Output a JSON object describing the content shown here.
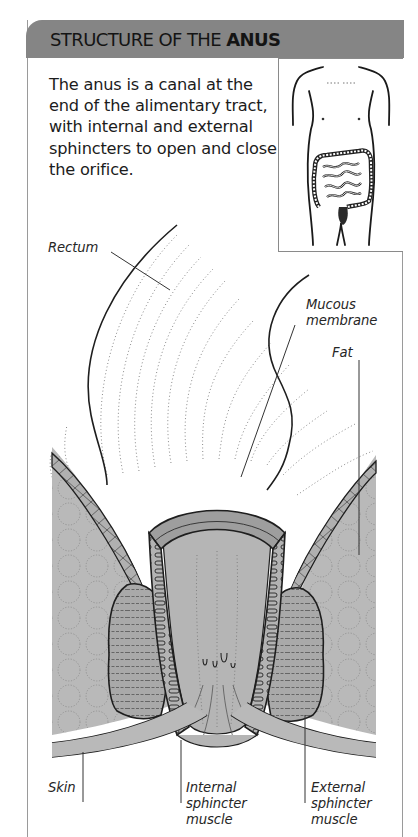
{
  "header": {
    "title_regular": "STRUCTURE OF THE ",
    "title_bold": "ANUS",
    "background_color": "#858585"
  },
  "intro": {
    "text": "The anus is a canal at the end of the alimentary tract, with internal and external sphincters to open and close the orifice."
  },
  "inset": {
    "description": "Torso outline showing large intestine and rectum location",
    "highlight": "anus"
  },
  "diagram": {
    "labels": {
      "rectum": "Rectum",
      "mucous_membrane": "Mucous\nmembrane",
      "fat": "Fat",
      "skin": "Skin",
      "internal_sphincter": "Internal\nsphincter\nmuscle",
      "external_sphincter": "External\nsphincter\nmuscle"
    },
    "colors": {
      "tissue": "#b8b8b8",
      "muscle": "#a6a6a6",
      "outline": "#1e1e1e"
    }
  }
}
